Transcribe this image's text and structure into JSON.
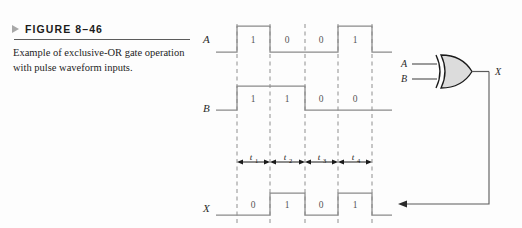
{
  "figure": {
    "marker_icon": "triangle-right-icon",
    "number_label": "FIGURE 8–46",
    "caption": "Example of exclusive-OR gate operation with pulse waveform inputs."
  },
  "timing_diagram": {
    "signals": [
      {
        "name": "A",
        "label": "A",
        "bits": [
          "1",
          "0",
          "0",
          "1"
        ]
      },
      {
        "name": "B",
        "label": "B",
        "bits": [
          "1",
          "1",
          "0",
          "0"
        ]
      },
      {
        "name": "X",
        "label": "X",
        "bits": [
          "0",
          "1",
          "0",
          "1"
        ]
      }
    ],
    "intervals": [
      {
        "base": "t",
        "sub": "1"
      },
      {
        "base": "t",
        "sub": "2"
      },
      {
        "base": "t",
        "sub": "3"
      },
      {
        "base": "t",
        "sub": "4"
      }
    ]
  },
  "gate": {
    "type": "exclusive-or-gate",
    "input_a_label": "A",
    "input_b_label": "B",
    "output_label": "X"
  },
  "colors": {
    "waveform": "#8a8a8a",
    "dashed_guide": "#8f8f8f",
    "gate_fill": "#dcdcdc",
    "gate_outline": "#1a1a1a",
    "rule": "#5c5c5c",
    "marker": "#a8a8a8"
  }
}
